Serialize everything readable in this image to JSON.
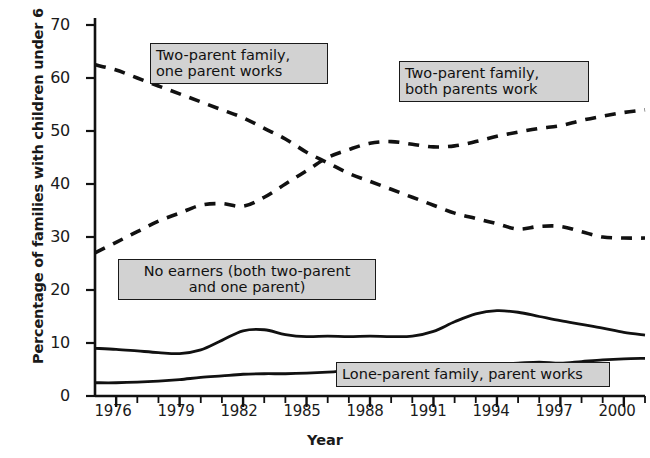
{
  "chart_data": {
    "type": "line",
    "title": "",
    "xlabel": "Year",
    "ylabel": "Percentage of families with children under 6",
    "xlim": [
      1975,
      2001
    ],
    "ylim": [
      0,
      72
    ],
    "yticks": [
      0,
      10,
      20,
      30,
      40,
      50,
      60,
      70
    ],
    "xticks": [
      1976,
      1979,
      1982,
      1985,
      1988,
      1991,
      1994,
      1997,
      2000
    ],
    "xtick_minor_step": 1,
    "grid": false,
    "legend": "inline-callout-boxes",
    "series": [
      {
        "name": "Two-parent family, one parent works",
        "style": "dashed",
        "x": [
          1975,
          1976,
          1977,
          1978,
          1979,
          1980,
          1981,
          1982,
          1983,
          1984,
          1985,
          1986,
          1987,
          1988,
          1989,
          1990,
          1991,
          1992,
          1993,
          1994,
          1995,
          1996,
          1997,
          1998,
          1999,
          2000,
          2001
        ],
        "values": [
          62.5,
          61.5,
          60.0,
          58.5,
          57.0,
          55.5,
          54.0,
          52.5,
          50.5,
          48.5,
          46.0,
          44.0,
          42.0,
          40.5,
          39.0,
          37.5,
          36.0,
          34.5,
          33.5,
          32.5,
          31.5,
          32.0,
          32.0,
          31.0,
          30.0,
          29.8,
          29.8
        ]
      },
      {
        "name": "Two-parent family, both parents work",
        "style": "dashed",
        "x": [
          1975,
          1976,
          1977,
          1978,
          1979,
          1980,
          1981,
          1982,
          1983,
          1984,
          1985,
          1986,
          1987,
          1988,
          1989,
          1990,
          1991,
          1992,
          1993,
          1994,
          1995,
          1996,
          1997,
          1998,
          1999,
          2000,
          2001
        ],
        "values": [
          27.0,
          29.0,
          31.0,
          33.0,
          34.5,
          36.0,
          36.3,
          35.8,
          37.5,
          40.0,
          42.5,
          45.0,
          46.5,
          47.7,
          48.0,
          47.5,
          47.0,
          47.2,
          48.0,
          49.0,
          49.8,
          50.5,
          51.0,
          52.0,
          52.8,
          53.5,
          54.0
        ]
      },
      {
        "name": "No earners (both two-parent and one parent)",
        "style": "solid",
        "x": [
          1975,
          1976,
          1977,
          1978,
          1979,
          1980,
          1981,
          1982,
          1983,
          1984,
          1985,
          1986,
          1987,
          1988,
          1989,
          1990,
          1991,
          1992,
          1993,
          1994,
          1995,
          1996,
          1997,
          1998,
          1999,
          2000,
          2001
        ],
        "values": [
          9.0,
          8.8,
          8.5,
          8.2,
          8.0,
          8.7,
          10.5,
          12.3,
          12.5,
          11.6,
          11.2,
          11.3,
          11.2,
          11.3,
          11.2,
          11.3,
          12.2,
          14.0,
          15.5,
          16.1,
          15.8,
          15.0,
          14.2,
          13.5,
          12.8,
          12.0,
          11.5
        ]
      },
      {
        "name": "Lone-parent family, parent works",
        "style": "solid",
        "x": [
          1975,
          1976,
          1977,
          1978,
          1979,
          1980,
          1981,
          1982,
          1983,
          1984,
          1985,
          1986,
          1987,
          1988,
          1989,
          1990,
          1991,
          1992,
          1993,
          1994,
          1995,
          1996,
          1997,
          1998,
          1999,
          2000,
          2001
        ],
        "values": [
          2.5,
          2.5,
          2.6,
          2.8,
          3.1,
          3.5,
          3.8,
          4.1,
          4.2,
          4.2,
          4.3,
          4.5,
          4.8,
          5.1,
          5.3,
          5.4,
          5.5,
          5.6,
          5.8,
          6.0,
          6.2,
          6.4,
          6.2,
          6.5,
          6.8,
          7.0,
          7.1
        ]
      }
    ]
  },
  "axes": {
    "y_title": "Percentage of families with children under 6",
    "x_title": "Year",
    "y_tick_labels": [
      "0",
      "10",
      "20",
      "30",
      "40",
      "50",
      "60",
      "70"
    ],
    "x_tick_labels": [
      "1976",
      "1979",
      "1982",
      "1985",
      "1988",
      "1991",
      "1994",
      "1997",
      "2000"
    ]
  },
  "callouts": [
    {
      "id": "two-parent-one-works",
      "line1": "Two-parent family,",
      "line2": "one parent works",
      "text": "Two-parent family,\none parent works"
    },
    {
      "id": "two-parent-both-work",
      "line1": "Two-parent family,",
      "line2": "both parents work",
      "text": "Two-parent family,\nboth parents work"
    },
    {
      "id": "no-earners",
      "line1": "No earners (both two-parent",
      "line2": "and one parent)",
      "text": "No earners (both two-parent\nand one parent)"
    },
    {
      "id": "lone-parent-works",
      "line1": "Lone-parent family, parent works",
      "line2": "",
      "text": "Lone-parent family, parent works"
    }
  ],
  "colors": {
    "line": "#111111",
    "callout_fill": "#d2d2d2",
    "callout_border": "#1a1a1a",
    "background": "#ffffff"
  }
}
